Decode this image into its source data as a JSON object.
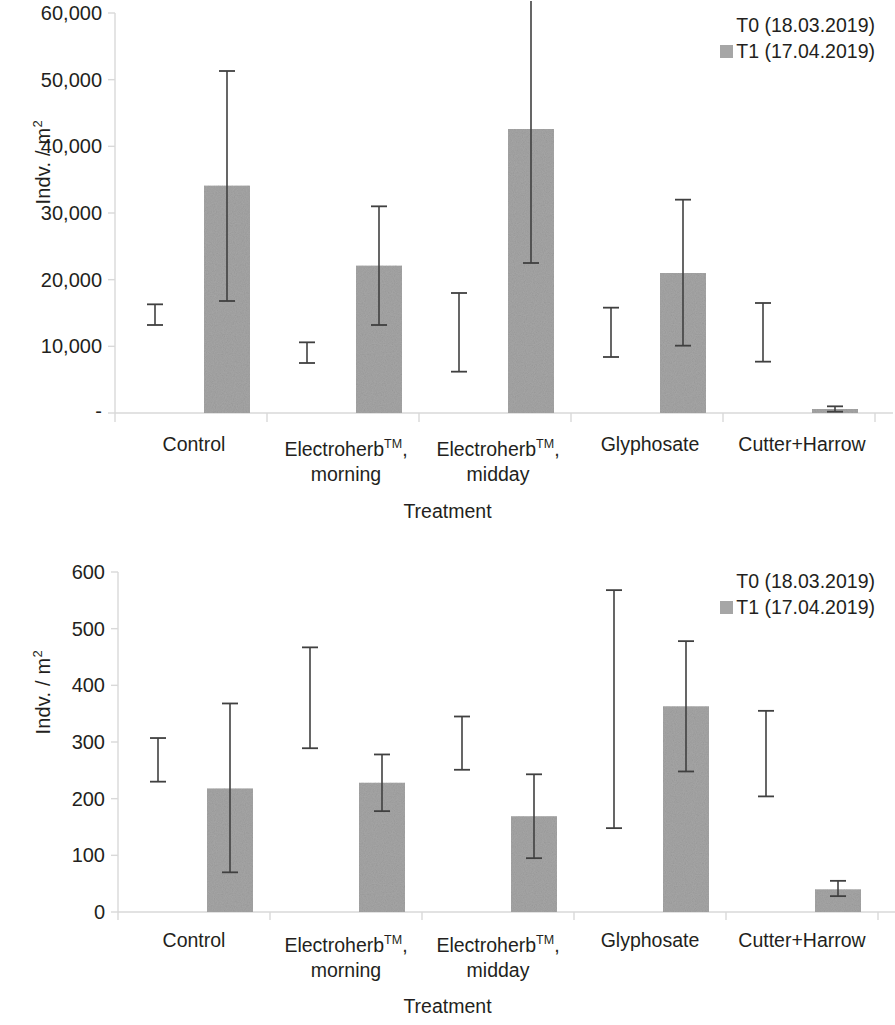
{
  "figure": {
    "axis_title_x": "Treatment",
    "axis_title_y": "Indv. / m",
    "axis_title_y_sup": "2",
    "categories": [
      "Control",
      "Electroherb™,\nmorning",
      "Electroherb™,\nmidday",
      "Glyphosate",
      "Cutter+Harrow"
    ],
    "category_plain": [
      "Control",
      "Electroherb, morning",
      "Electroherb, midday",
      "Glyphosate",
      "Cutter+Harrow"
    ],
    "legend": [
      {
        "label": "T0 (18.03.2019)",
        "swatch": "none"
      },
      {
        "label": "T1 (17.04.2019)",
        "swatch": "#a6a6a6"
      }
    ],
    "colors": {
      "bar_fill": "#a6a6a6",
      "error_bar": "#404040",
      "axis": "#d9d9d9",
      "text": "#231f20"
    }
  },
  "chart_data": [
    {
      "type": "bar",
      "title": "",
      "xlabel": "Treatment",
      "ylabel": "Indv. / m2",
      "categories": [
        "Control",
        "Electroherb™, morning",
        "Electroherb™, midday",
        "Glyphosate",
        "Cutter+Harrow"
      ],
      "ylim": [
        0,
        60000
      ],
      "yticks": [
        0,
        10000,
        20000,
        30000,
        40000,
        50000,
        60000
      ],
      "ytick_labels": [
        "-",
        "10,000",
        "20,000",
        "30,000",
        "40,000",
        "50,000",
        "60,000"
      ],
      "grid": false,
      "legend_position": "top-right",
      "series": [
        {
          "name": "T0 (18.03.2019)",
          "render": "error-bar-only",
          "values": [
            14700,
            9000,
            12100,
            12100,
            12100
          ],
          "err_low": [
            13200,
            7500,
            6200,
            8400,
            7700
          ],
          "err_high": [
            16300,
            10600,
            18000,
            15800,
            16500
          ]
        },
        {
          "name": "T1 (17.04.2019)",
          "render": "bar",
          "values": [
            34100,
            22100,
            42600,
            21000,
            600
          ],
          "err_low": [
            16800,
            13200,
            22500,
            10100,
            200
          ],
          "err_high": [
            51300,
            31000,
            68000,
            32000,
            1000
          ],
          "err_high_clipped": [
            false,
            false,
            true,
            false,
            false
          ]
        }
      ]
    },
    {
      "type": "bar",
      "title": "",
      "xlabel": "Treatment",
      "ylabel": "Indv. / m2",
      "categories": [
        "Control",
        "Electroherb™, morning",
        "Electroherb™, midday",
        "Glyphosate",
        "Cutter+Harrow"
      ],
      "ylim": [
        0,
        600
      ],
      "yticks": [
        0,
        100,
        200,
        300,
        400,
        500,
        600
      ],
      "ytick_labels": [
        "0",
        "100",
        "200",
        "300",
        "400",
        "500",
        "600"
      ],
      "grid": false,
      "legend_position": "top-right",
      "series": [
        {
          "name": "T0 (18.03.2019)",
          "render": "error-bar-only",
          "values": [
            268,
            378,
            298,
            358,
            280
          ],
          "err_low": [
            230,
            289,
            251,
            148,
            204
          ],
          "err_high": [
            307,
            467,
            345,
            568,
            355
          ]
        },
        {
          "name": "T1 (17.04.2019)",
          "render": "bar",
          "values": [
            218,
            228,
            169,
            363,
            40
          ],
          "err_low": [
            70,
            178,
            95,
            248,
            28
          ],
          "err_high": [
            368,
            278,
            243,
            478,
            55
          ]
        }
      ]
    }
  ]
}
